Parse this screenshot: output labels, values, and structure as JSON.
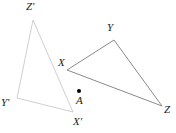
{
  "figure": {
    "width": 176,
    "height": 133,
    "background": "#ffffff"
  },
  "colors": {
    "preimage_stroke": "#7a7a7a",
    "image_stroke": "#cfcfcf",
    "label_text": "#1a1a1a",
    "center_point": "#000000"
  },
  "shapes": [
    {
      "name": "triangle-xyz",
      "role": "preimage",
      "stroke": "#7a7a7a",
      "stroke_width": 1,
      "fill": "none",
      "vertices": [
        {
          "label": "X",
          "x": 67,
          "y": 70
        },
        {
          "label": "Y",
          "x": 114,
          "y": 40
        },
        {
          "label": "Z",
          "x": 162,
          "y": 106
        }
      ]
    },
    {
      "name": "triangle-x-prime-y-prime-z-prime",
      "role": "image",
      "stroke": "#cfcfcf",
      "stroke_width": 1,
      "fill": "none",
      "vertices": [
        {
          "label": "X'",
          "x": 73,
          "y": 112
        },
        {
          "label": "Y'",
          "x": 17,
          "y": 98
        },
        {
          "label": "Z'",
          "x": 33,
          "y": 20
        }
      ]
    }
  ],
  "points": [
    {
      "name": "center-of-rotation",
      "label": "A",
      "x": 79,
      "y": 91,
      "radius": 2
    }
  ],
  "labels": [
    {
      "key": "z_prime",
      "text": "Z'",
      "x": 26,
      "y": 1
    },
    {
      "key": "y_upper",
      "text": "Y",
      "x": 107,
      "y": 22
    },
    {
      "key": "x_vertex",
      "text": "X",
      "x": 58,
      "y": 57
    },
    {
      "key": "y_prime",
      "text": "Y'",
      "x": 1,
      "y": 97
    },
    {
      "key": "a_center",
      "text": "A",
      "x": 76,
      "y": 95
    },
    {
      "key": "x_prime",
      "text": "X'",
      "x": 73,
      "y": 116
    },
    {
      "key": "z_vertex",
      "text": "Z",
      "x": 164,
      "y": 104
    }
  ]
}
